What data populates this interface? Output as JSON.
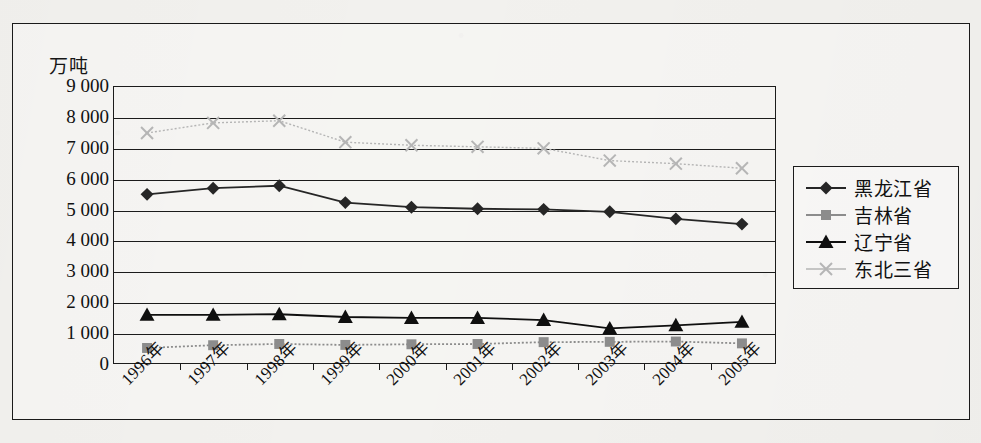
{
  "figure": {
    "y_axis_unit": "万吨"
  },
  "legend": {
    "items": [
      {
        "label": "黑龙江省",
        "marker": "diamond-marker-icon",
        "color": "#262626"
      },
      {
        "label": "吉林省",
        "marker": "square-marker-icon",
        "color": "#8c8c8c"
      },
      {
        "label": "辽宁省",
        "marker": "triangle-marker-icon",
        "color": "#0f0f0f"
      },
      {
        "label": "东北三省",
        "marker": "cross-marker-icon",
        "color": "#b5b5b5"
      }
    ]
  },
  "chart_data": {
    "type": "line",
    "title": "",
    "xlabel": "",
    "ylabel": "万吨",
    "ylim": [
      0,
      9000
    ],
    "ytick_step": 1000,
    "ytick_labels": [
      "0",
      "1 000",
      "2 000",
      "3 000",
      "4 000",
      "5 000",
      "6 000",
      "7 000",
      "8 000",
      "9 000"
    ],
    "grid": true,
    "legend_position": "right",
    "categories": [
      "1996年",
      "1997年",
      "1998年",
      "1999年",
      "2000年",
      "2001年",
      "2002年",
      "2003年",
      "2004年",
      "2005年"
    ],
    "series": [
      {
        "name": "黑龙江省",
        "color": "#262626",
        "marker": "diamond",
        "values": [
          5500,
          5700,
          5780,
          5230,
          5080,
          5030,
          5010,
          4930,
          4700,
          4530
        ]
      },
      {
        "name": "吉林省",
        "color": "#8c8c8c",
        "marker": "square",
        "values": [
          490,
          580,
          620,
          590,
          610,
          620,
          680,
          690,
          700,
          640
        ]
      },
      {
        "name": "辽宁省",
        "color": "#0f0f0f",
        "marker": "triangle",
        "values": [
          1570,
          1570,
          1590,
          1500,
          1470,
          1470,
          1400,
          1130,
          1230,
          1340
        ]
      },
      {
        "name": "东北三省",
        "color": "#b5b5b5",
        "marker": "cross",
        "values": [
          7500,
          7830,
          7900,
          7200,
          7100,
          7050,
          7000,
          6600,
          6500,
          6350
        ]
      }
    ]
  }
}
